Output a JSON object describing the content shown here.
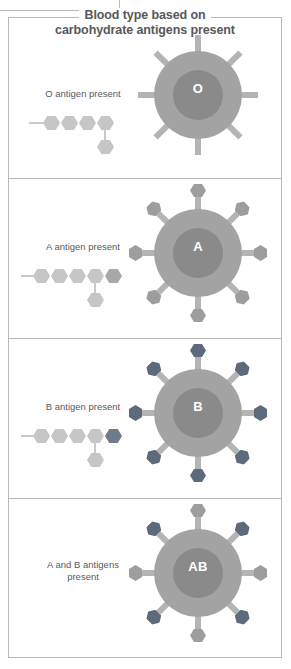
{
  "figure": {
    "title_line1": "Blood type based on",
    "title_line2": "carbohydrate antigens present",
    "title_color": "#58585a",
    "border_color": "#b9b9b9",
    "background": "#ffffff"
  },
  "colors": {
    "cell_outer": "#a3a3a3",
    "cell_inner": "#8a8a8a",
    "spoke": "#b4b4b4",
    "antigen_light": "#9d9d9d",
    "antigen_dark": "#5d6a7b",
    "chain_sugar": "#c6c6c6",
    "chain_sugar_dark": "#6e7b8c",
    "chain_stem": "#c9c9c9",
    "letter": "#ffffff"
  },
  "panels": [
    {
      "id": "o",
      "label": "O antigen present",
      "cell_letter": "O",
      "chain": {
        "row_count": 4,
        "row_kinds": [
          "light",
          "light",
          "light",
          "light"
        ],
        "branch_kind": "light",
        "branch_under_index": 3
      },
      "spokes": {
        "count": 8,
        "tips": [
          "none",
          "none",
          "none",
          "none",
          "none",
          "none",
          "none",
          "none"
        ]
      }
    },
    {
      "id": "a",
      "label": "A antigen present",
      "cell_letter": "A",
      "chain": {
        "row_count": 5,
        "row_kinds": [
          "light",
          "light",
          "light",
          "light",
          "mid"
        ],
        "branch_kind": "light",
        "branch_under_index": 3
      },
      "spokes": {
        "count": 8,
        "tips": [
          "light",
          "light",
          "light",
          "light",
          "light",
          "light",
          "light",
          "light"
        ]
      }
    },
    {
      "id": "b",
      "label": "B antigen present",
      "cell_letter": "B",
      "chain": {
        "row_count": 5,
        "row_kinds": [
          "light",
          "light",
          "light",
          "light",
          "dark"
        ],
        "branch_kind": "light",
        "branch_under_index": 3
      },
      "spokes": {
        "count": 8,
        "tips": [
          "dark",
          "dark",
          "dark",
          "dark",
          "dark",
          "dark",
          "dark",
          "dark"
        ]
      }
    },
    {
      "id": "ab",
      "label_line1": "A and B antigens",
      "label_line2": "present",
      "label": "A and B antigens present",
      "cell_letter": "AB",
      "chain": null,
      "spokes": {
        "count": 8,
        "tips": [
          "light",
          "dark",
          "light",
          "dark",
          "light",
          "dark",
          "light",
          "dark"
        ]
      }
    }
  ]
}
